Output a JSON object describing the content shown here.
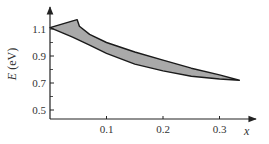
{
  "chart_data": {
    "type": "area",
    "title": "",
    "xlabel": "x",
    "ylabel": "E (eV)",
    "xlim": [
      0,
      0.37
    ],
    "ylim": [
      0.42,
      1.24
    ],
    "x_ticks": [
      "0.1",
      "0.2",
      "0.3"
    ],
    "y_ticks": [
      "0.5",
      "0.7",
      "0.9",
      "1.1"
    ],
    "grid": false,
    "legend": null,
    "fill_color": "#a9a9a9",
    "series": [
      {
        "name": "upper boundary",
        "points": [
          [
            0.0,
            1.11
          ],
          [
            0.048,
            1.17
          ],
          [
            0.052,
            1.12
          ],
          [
            0.07,
            1.06
          ],
          [
            0.1,
            1.0
          ],
          [
            0.15,
            0.93
          ],
          [
            0.2,
            0.87
          ],
          [
            0.25,
            0.81
          ],
          [
            0.3,
            0.76
          ],
          [
            0.335,
            0.72
          ]
        ]
      },
      {
        "name": "lower boundary",
        "points": [
          [
            0.0,
            1.11
          ],
          [
            0.04,
            1.04
          ],
          [
            0.07,
            0.98
          ],
          [
            0.1,
            0.92
          ],
          [
            0.15,
            0.84
          ],
          [
            0.2,
            0.79
          ],
          [
            0.25,
            0.75
          ],
          [
            0.3,
            0.73
          ],
          [
            0.335,
            0.72
          ]
        ]
      }
    ]
  }
}
